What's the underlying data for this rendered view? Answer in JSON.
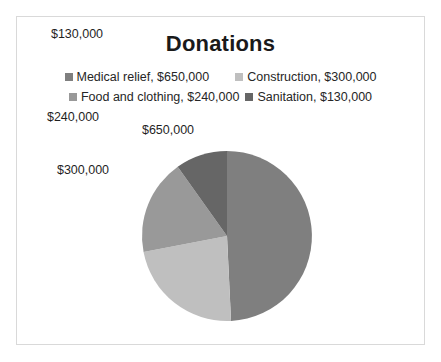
{
  "chart": {
    "title": "Donations",
    "border_color": "#d9d9d9",
    "background": "#ffffff"
  },
  "legend": {
    "rows": [
      [
        {
          "label": "Medical relief, $650,000",
          "color": "#7f7f7f",
          "icon": "legend-square-icon"
        },
        {
          "label": "Construction, $300,000",
          "color": "#bfbfbf",
          "icon": "legend-square-icon"
        }
      ],
      [
        {
          "label": "Food and clothing, $240,000",
          "color": "#999999",
          "icon": "legend-square-icon"
        },
        {
          "label": "Sanitation, $130,000",
          "color": "#666666",
          "icon": "legend-square-icon"
        }
      ]
    ]
  },
  "pie_labels": [
    {
      "text": "$130,000",
      "x": 60,
      "y": 17
    },
    {
      "text": "$240,000",
      "x": 56,
      "y": 100
    },
    {
      "text": "$300,000",
      "x": 66,
      "y": 153
    },
    {
      "text": "$650,000",
      "x": 151,
      "y": 113
    }
  ],
  "chart_data": {
    "type": "pie",
    "title": "Donations",
    "labels": [
      "Medical relief",
      "Construction",
      "Food and clothing",
      "Sanitation"
    ],
    "values": [
      650000,
      300000,
      240000,
      130000
    ],
    "value_labels": [
      "$650,000",
      "$300,000",
      "$240,000",
      "$130,000"
    ],
    "total": 1320000,
    "percentages": [
      49.24,
      22.73,
      18.18,
      9.85
    ],
    "colors": [
      "#7f7f7f",
      "#bfbfbf",
      "#999999",
      "#666666"
    ],
    "slice_order": [
      "Medical relief",
      "Construction",
      "Food and clothing",
      "Sanitation"
    ],
    "start_angle_deg": 0,
    "direction": "clockwise",
    "legend_position": "top",
    "grid": false,
    "center": {
      "cx": 226,
      "cy": 235
    },
    "radius": 85
  }
}
